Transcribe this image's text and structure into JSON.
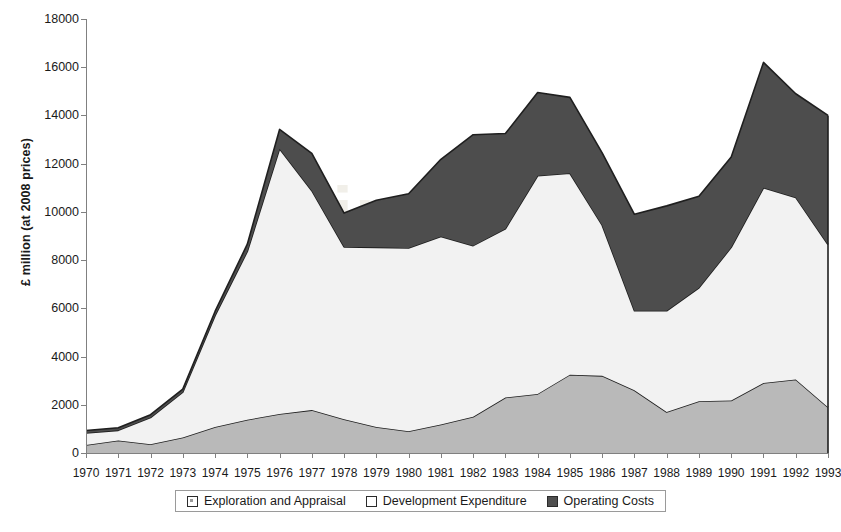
{
  "chart_data": {
    "type": "area",
    "stacked": true,
    "title": "",
    "xlabel": "",
    "ylabel": "£ million (at 2008 prices)",
    "categories": [
      "1970",
      "1971",
      "1972",
      "1973",
      "1974",
      "1975",
      "1976",
      "1977",
      "1978",
      "1979",
      "1980",
      "1981",
      "1982",
      "1983",
      "1984",
      "1985",
      "1986",
      "1987",
      "1988",
      "1989",
      "1990",
      "1991",
      "1992",
      "1993"
    ],
    "ylim": [
      0,
      18000
    ],
    "yticks": [
      0,
      2000,
      4000,
      6000,
      8000,
      10000,
      12000,
      14000,
      16000,
      18000
    ],
    "grid": false,
    "legend_position": "bottom",
    "series": [
      {
        "name": "Exploration and Appraisal",
        "color": "#b9b9b9",
        "values": [
          330,
          520,
          360,
          640,
          1080,
          1380,
          1620,
          1780,
          1400,
          1080,
          900,
          1180,
          1500,
          2300,
          2450,
          3250,
          3200,
          2600,
          1700,
          2150,
          2180,
          2900,
          3050,
          1900
        ]
      },
      {
        "name": "Development Expenditure",
        "color": "#f2f2f2",
        "values": [
          500,
          420,
          1110,
          1880,
          4620,
          6980,
          11000,
          9100,
          7150,
          7450,
          7600,
          7800,
          7100,
          7000,
          9050,
          8350,
          6250,
          3300,
          4200,
          4700,
          6350,
          8100,
          7550,
          6750
        ]
      },
      {
        "name": "Operating Costs",
        "color": "#4d4d4d",
        "values": [
          100,
          110,
          120,
          130,
          170,
          300,
          800,
          1550,
          1400,
          1950,
          2250,
          3200,
          4600,
          3950,
          3450,
          3150,
          3000,
          4000,
          4350,
          3800,
          3750,
          5200,
          4300,
          5350
        ]
      }
    ],
    "totals": [
      930,
      1050,
      1590,
      2650,
      5870,
      8660,
      13420,
      12430,
      9950,
      10480,
      10750,
      12180,
      13200,
      13250,
      14950,
      14750,
      12450,
      9900,
      10250,
      10650,
      12280,
      16200,
      14900,
      14000
    ]
  },
  "legend": {
    "items": [
      {
        "label": "Exploration and Appraisal"
      },
      {
        "label": "Development Expenditure"
      },
      {
        "label": "Operating Costs"
      }
    ]
  },
  "watermark": {
    "line1": "Since",
    "line2": "Rep"
  }
}
